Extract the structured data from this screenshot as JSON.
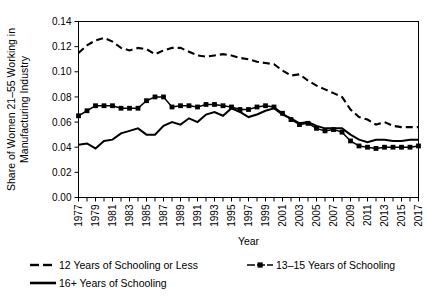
{
  "chart_data": {
    "type": "line",
    "title": "",
    "xlabel": "Year",
    "ylabel": "Share of Women 21–55 Working in Manufacturing Industry",
    "ylabel_lines": [
      "Share of Women 21–55 Working in",
      "Manufacturing Industry"
    ],
    "xlim": [
      1977,
      2017
    ],
    "ylim": [
      0.0,
      0.14
    ],
    "ytick_labels": [
      "0.00",
      "0.02",
      "0.04",
      "0.06",
      "0.08",
      "0.10",
      "0.12",
      "0.14"
    ],
    "ytick_values": [
      0.0,
      0.02,
      0.04,
      0.06,
      0.08,
      0.1,
      0.12,
      0.14
    ],
    "xtick_labels": [
      "1977",
      "1979",
      "1981",
      "1983",
      "1985",
      "1987",
      "1989",
      "1991",
      "1993",
      "1995",
      "1997",
      "1999",
      "2001",
      "2003",
      "2005",
      "2007",
      "2009",
      "2011",
      "2013",
      "2015",
      "2017"
    ],
    "xtick_values": [
      1977,
      1979,
      1981,
      1983,
      1985,
      1987,
      1989,
      1991,
      1993,
      1995,
      1997,
      1999,
      2001,
      2003,
      2005,
      2007,
      2009,
      2011,
      2013,
      2015,
      2017
    ],
    "x": [
      1977,
      1978,
      1979,
      1980,
      1981,
      1982,
      1983,
      1984,
      1985,
      1986,
      1987,
      1988,
      1989,
      1990,
      1991,
      1992,
      1993,
      1994,
      1995,
      1996,
      1997,
      1998,
      1999,
      2000,
      2001,
      2002,
      2003,
      2004,
      2005,
      2006,
      2007,
      2008,
      2009,
      2010,
      2011,
      2012,
      2013,
      2014,
      2015,
      2016,
      2017
    ],
    "grid": false,
    "legend_position": "bottom-left",
    "series": [
      {
        "name": "12 Years of Schooling or Less",
        "style": "dashed",
        "marker": "none",
        "color": "#000000",
        "values": [
          0.115,
          0.121,
          0.125,
          0.127,
          0.124,
          0.119,
          0.117,
          0.119,
          0.118,
          0.114,
          0.117,
          0.119,
          0.119,
          0.116,
          0.113,
          0.112,
          0.113,
          0.114,
          0.113,
          0.111,
          0.11,
          0.108,
          0.107,
          0.106,
          0.101,
          0.097,
          0.098,
          0.093,
          0.089,
          0.086,
          0.083,
          0.08,
          0.07,
          0.064,
          0.062,
          0.058,
          0.06,
          0.057,
          0.056,
          0.056,
          0.056
        ]
      },
      {
        "name": "13–15 Years of Schooling",
        "style": "solid",
        "marker": "square",
        "color": "#000000",
        "values": [
          0.065,
          0.069,
          0.073,
          0.073,
          0.073,
          0.071,
          0.071,
          0.071,
          0.077,
          0.08,
          0.08,
          0.072,
          0.073,
          0.073,
          0.072,
          0.074,
          0.074,
          0.073,
          0.072,
          0.07,
          0.07,
          0.072,
          0.073,
          0.072,
          0.067,
          0.062,
          0.058,
          0.059,
          0.055,
          0.053,
          0.054,
          0.052,
          0.045,
          0.041,
          0.04,
          0.039,
          0.04,
          0.04,
          0.04,
          0.04,
          0.041
        ]
      },
      {
        "name": "16+ Years of Schooling",
        "style": "solid",
        "marker": "none",
        "color": "#000000",
        "values": [
          0.042,
          0.043,
          0.039,
          0.045,
          0.046,
          0.051,
          0.053,
          0.055,
          0.05,
          0.05,
          0.057,
          0.06,
          0.058,
          0.063,
          0.06,
          0.066,
          0.068,
          0.065,
          0.071,
          0.068,
          0.064,
          0.066,
          0.069,
          0.071,
          0.066,
          0.063,
          0.059,
          0.06,
          0.057,
          0.055,
          0.055,
          0.055,
          0.05,
          0.046,
          0.044,
          0.046,
          0.046,
          0.045,
          0.045,
          0.046,
          0.046
        ]
      }
    ]
  },
  "legend": {
    "entries": [
      {
        "label": "12 Years of Schooling or Less"
      },
      {
        "label": "13–15 Years of Schooling"
      },
      {
        "label": "16+ Years of Schooling"
      }
    ]
  }
}
